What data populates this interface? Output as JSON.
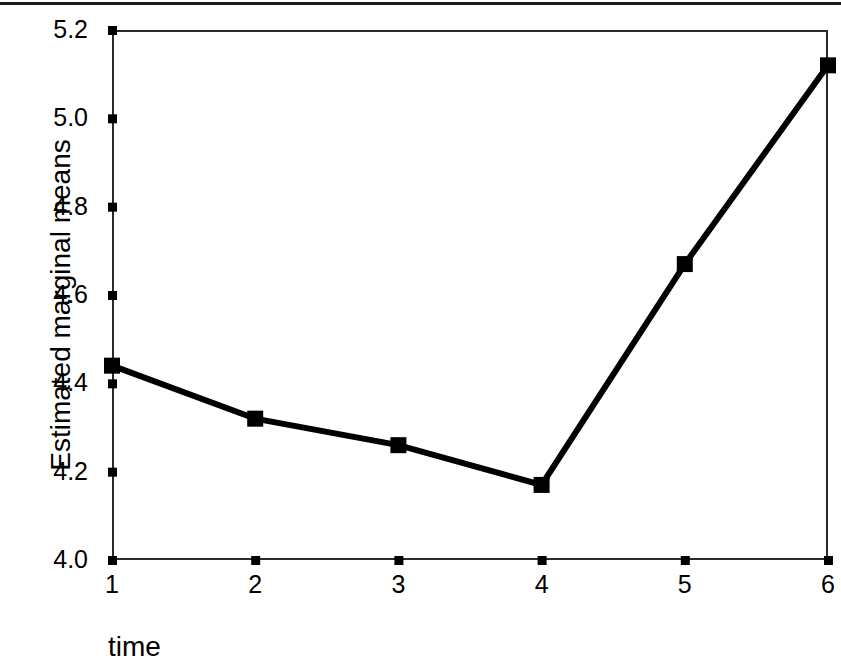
{
  "figure": {
    "background_color": "#ffffff",
    "ink_color": "#000000",
    "top_rule": true
  },
  "chart_data": {
    "type": "line",
    "title": "",
    "subtitle": "",
    "xlabel": "time",
    "ylabel": "Estimated marginal means",
    "x": [
      1,
      2,
      3,
      4,
      5,
      6
    ],
    "xticklabels": [
      "1",
      "2",
      "3",
      "4",
      "5",
      "6"
    ],
    "values": [
      4.44,
      4.32,
      4.26,
      4.17,
      4.67,
      5.12
    ],
    "yticks": [
      4.0,
      4.2,
      4.4,
      4.6,
      4.8,
      5.0,
      5.2
    ],
    "yticklabels": [
      "4.0",
      "4.2",
      "4.4",
      "4.6",
      "4.8",
      "5.0",
      "5.2"
    ],
    "xlim": [
      1,
      6
    ],
    "ylim": [
      4.0,
      5.2
    ],
    "grid": false,
    "legend": null,
    "series": [
      {
        "name": "Estimated marginal means",
        "values": [
          4.44,
          4.32,
          4.26,
          4.17,
          4.67,
          5.12
        ],
        "line_color": "#000000",
        "line_width": 6,
        "marker": "square",
        "marker_color": "#000000",
        "marker_size": 16
      }
    ]
  },
  "axes": {
    "frame_color": "#2b2b2b",
    "tick_color": "#000000",
    "y_axis_name": "y-axis",
    "x_axis_name": "x-axis"
  }
}
